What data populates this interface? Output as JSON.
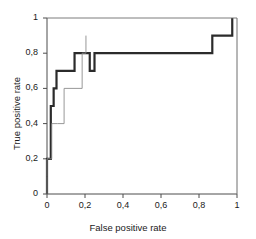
{
  "chart_data": {
    "type": "line",
    "title": "",
    "subtitle": "",
    "xlabel": "False positive rate",
    "ylabel": "True positive rate",
    "xlim": [
      0,
      1
    ],
    "ylim": [
      0,
      1
    ],
    "grid": false,
    "legend": "none",
    "xticks": [
      0,
      0.2,
      0.4,
      0.6,
      0.8,
      1
    ],
    "yticks": [
      0,
      0.2,
      0.4,
      0.6,
      0.8,
      1
    ],
    "xtick_labels": [
      "0",
      "0,2",
      "0,4",
      "0,6",
      "0,8",
      "1"
    ],
    "ytick_labels": [
      "0",
      "0,2",
      "0,4",
      "0,6",
      "0,8",
      "1"
    ],
    "series": [
      {
        "name": "roc-curve-bold",
        "style": "step",
        "linewidth": 2.2,
        "color": "#2b2b2b",
        "x": [
          0,
          0,
          0,
          0.02,
          0.02,
          0.035,
          0.035,
          0.05,
          0.05,
          0.05,
          0.145,
          0.145,
          0.225,
          0.225,
          0.25,
          0.25,
          0.87,
          0.87,
          0.975,
          0.975
        ],
        "y": [
          0,
          0.1,
          0.2,
          0.2,
          0.5,
          0.5,
          0.6,
          0.6,
          0.6,
          0.7,
          0.7,
          0.8,
          0.8,
          0.7,
          0.7,
          0.8,
          0.8,
          0.9,
          0.9,
          1.0
        ]
      },
      {
        "name": "roc-curve-thin",
        "style": "step",
        "linewidth": 0.9,
        "color": "#8c8c8c",
        "x": [
          0,
          0,
          0,
          0.025,
          0.025,
          0.055,
          0.055,
          0.09,
          0.09,
          0.09,
          0.185,
          0.185,
          0.205,
          0.205
        ],
        "y": [
          0,
          0.1,
          0.2,
          0.2,
          0.4,
          0.4,
          0.4,
          0.4,
          0.5,
          0.6,
          0.6,
          0.8,
          0.8,
          0.9
        ]
      },
      {
        "name": "chance-reference-top",
        "style": "line",
        "linewidth": 0.9,
        "color": "#6e6e6e",
        "x": [
          0,
          1
        ],
        "y": [
          1.0,
          1.0
        ]
      }
    ],
    "annotations": []
  },
  "axes": {
    "xlabel": "False positive rate",
    "ylabel": "True positive rate",
    "xtick_labels": [
      "0",
      "0,2",
      "0,4",
      "0,6",
      "0,8",
      "1"
    ],
    "ytick_labels": [
      "0",
      "0,2",
      "0,4",
      "0,6",
      "0,8",
      "1"
    ]
  },
  "colors": {
    "background": "#ffffff",
    "axis": "#4d4d4d",
    "bold_curve": "#2b2b2b",
    "thin_curve": "#8c8c8c",
    "text": "#1a1a1a"
  }
}
